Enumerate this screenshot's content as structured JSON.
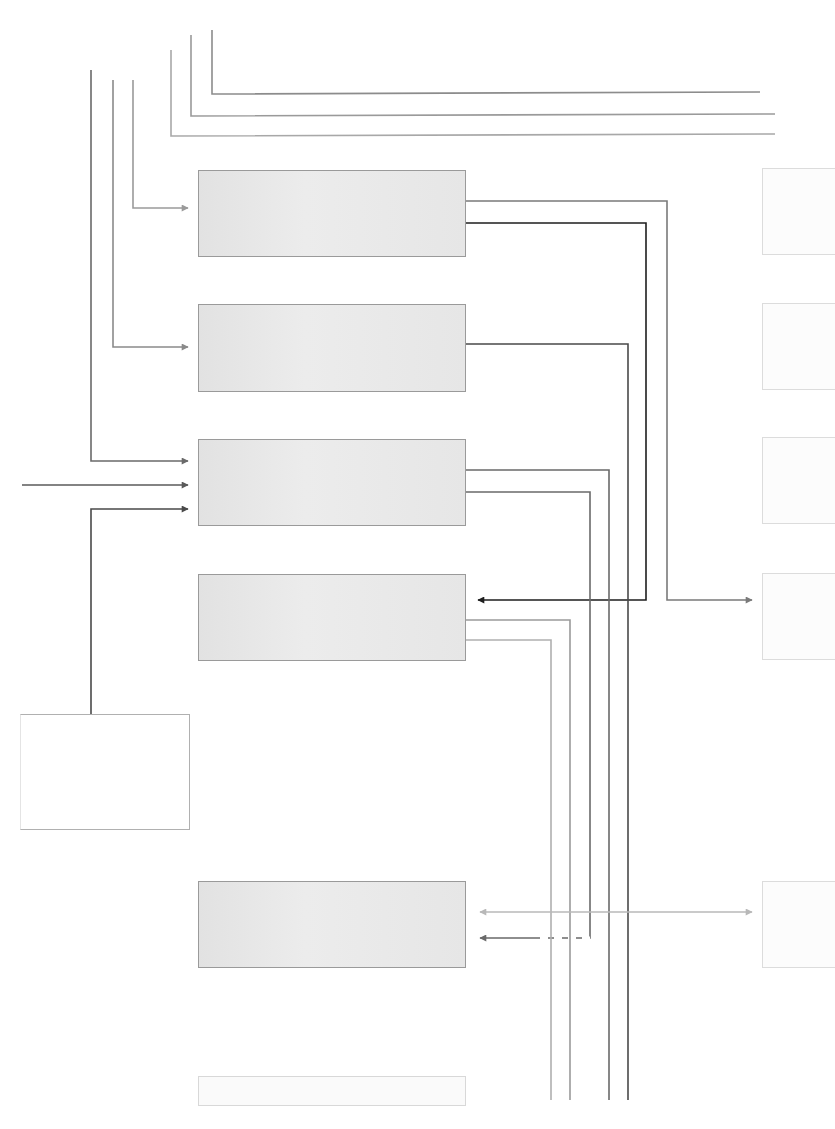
{
  "diagram": {
    "title": "",
    "blocks": [
      {
        "id": "block-1",
        "label": "",
        "x": 198,
        "y": 170,
        "w": 268,
        "h": 87,
        "style": "main"
      },
      {
        "id": "block-2",
        "label": "",
        "x": 198,
        "y": 304,
        "w": 268,
        "h": 88,
        "style": "main"
      },
      {
        "id": "block-3",
        "label": "",
        "x": 198,
        "y": 439,
        "w": 268,
        "h": 87,
        "style": "main"
      },
      {
        "id": "block-4",
        "label": "",
        "x": 198,
        "y": 574,
        "w": 268,
        "h": 87,
        "style": "main"
      },
      {
        "id": "block-5",
        "label": "",
        "x": 198,
        "y": 881,
        "w": 268,
        "h": 87,
        "style": "main"
      },
      {
        "id": "block-6",
        "label": "",
        "x": 198,
        "y": 1076,
        "w": 268,
        "h": 30,
        "style": "faded"
      },
      {
        "id": "block-left",
        "label": "",
        "x": 20,
        "y": 714,
        "w": 170,
        "h": 116,
        "style": "side"
      },
      {
        "id": "ext-1",
        "label": "",
        "x": 762,
        "y": 168,
        "w": 73,
        "h": 87,
        "style": "ext"
      },
      {
        "id": "ext-2",
        "label": "",
        "x": 762,
        "y": 303,
        "w": 73,
        "h": 87,
        "style": "ext"
      },
      {
        "id": "ext-3",
        "label": "",
        "x": 762,
        "y": 437,
        "w": 73,
        "h": 87,
        "style": "ext"
      },
      {
        "id": "ext-4",
        "label": "",
        "x": 762,
        "y": 573,
        "w": 73,
        "h": 87,
        "style": "ext"
      },
      {
        "id": "ext-5",
        "label": "",
        "x": 762,
        "y": 881,
        "w": 73,
        "h": 87,
        "style": "ext"
      }
    ],
    "connectors": [
      {
        "id": "top-bus-1",
        "points": [
          [
            212,
            30
          ],
          [
            212,
            94
          ],
          [
            760,
            92
          ]
        ],
        "color": "#8c8c8c",
        "arrow": false
      },
      {
        "id": "top-bus-2",
        "points": [
          [
            191,
            35
          ],
          [
            191,
            116
          ],
          [
            775,
            114
          ]
        ],
        "color": "#9a9a9a",
        "arrow": false
      },
      {
        "id": "top-bus-3",
        "points": [
          [
            171,
            50
          ],
          [
            171,
            136
          ],
          [
            775,
            134
          ]
        ],
        "color": "#a8a8a8",
        "arrow": false
      },
      {
        "id": "in-block-1",
        "points": [
          [
            133,
            80
          ],
          [
            133,
            208
          ],
          [
            188,
            208
          ]
        ],
        "color": "#9a9a9a",
        "arrow": true
      },
      {
        "id": "in-block-2",
        "points": [
          [
            113,
            80
          ],
          [
            113,
            347
          ],
          [
            188,
            347
          ]
        ],
        "color": "#8a8a8a",
        "arrow": true
      },
      {
        "id": "in-block-3a",
        "points": [
          [
            91,
            70
          ],
          [
            91,
            461
          ],
          [
            188,
            461
          ]
        ],
        "color": "#6a6a6a",
        "arrow": true
      },
      {
        "id": "in-block-3b",
        "points": [
          [
            22,
            485
          ],
          [
            188,
            485
          ]
        ],
        "color": "#5a5a5a",
        "arrow": true
      },
      {
        "id": "in-block-3c",
        "points": [
          [
            91,
            714
          ],
          [
            91,
            509
          ],
          [
            188,
            509
          ]
        ],
        "color": "#4a4a4a",
        "arrow": true
      },
      {
        "id": "out-block-1a",
        "points": [
          [
            466,
            201
          ],
          [
            667,
            201
          ],
          [
            667,
            600
          ],
          [
            752,
            600
          ]
        ],
        "color": "#7a7a7a",
        "arrow": true
      },
      {
        "id": "out-block-1b",
        "points": [
          [
            466,
            223
          ],
          [
            646,
            223
          ],
          [
            646,
            600
          ],
          [
            478,
            600
          ]
        ],
        "color": "#1e1e1e",
        "arrow": true
      },
      {
        "id": "out-block-2",
        "points": [
          [
            466,
            344
          ],
          [
            628,
            344
          ],
          [
            628,
            1100
          ]
        ],
        "color": "#4a4a4a",
        "arrow": false
      },
      {
        "id": "out-block-3a",
        "points": [
          [
            466,
            470
          ],
          [
            609,
            470
          ],
          [
            609,
            1100
          ]
        ],
        "color": "#6a6a6a",
        "arrow": false
      },
      {
        "id": "out-block-3b",
        "points": [
          [
            466,
            492
          ],
          [
            590,
            492
          ],
          [
            590,
            938
          ],
          [
            480,
            938
          ]
        ],
        "color": "#6a6a6a",
        "arrow": true,
        "dashed_segment": [
          [
            590,
            938
          ],
          [
            540,
            938
          ]
        ]
      },
      {
        "id": "out-block-4a",
        "points": [
          [
            466,
            620
          ],
          [
            570,
            620
          ],
          [
            570,
            1100
          ]
        ],
        "color": "#9a9a9a",
        "arrow": false
      },
      {
        "id": "out-block-4b",
        "points": [
          [
            466,
            640
          ],
          [
            551,
            640
          ],
          [
            551,
            1100
          ]
        ],
        "color": "#b0b0b0",
        "arrow": false
      },
      {
        "id": "bidir-block-5",
        "points": [
          [
            752,
            912
          ],
          [
            480,
            912
          ]
        ],
        "color": "#b8b8b8",
        "arrow": true,
        "arrow_both": true
      }
    ]
  }
}
